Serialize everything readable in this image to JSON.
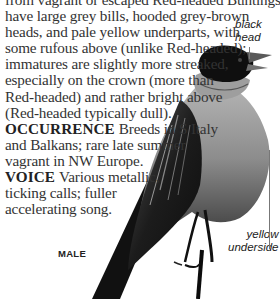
{
  "page": {
    "type": "field-guide-species-entry",
    "description_lines": [
      "from vagrant or escaped Red-headed Buntings. Females",
      "have large grey bills, hooded grey-brown",
      "heads, and pale yellow underparts, with",
      "some rufous above (unlike Red-headed);",
      "immatures are slightly more streaked,",
      "especially on the crown (more than",
      "Red-headed) and rather bright above",
      "(Red-headed typically dull)."
    ],
    "occurrence": {
      "heading": "OCCURRENCE",
      "lines": [
        "Breeds in S Italy",
        "and Balkans; rare late summer",
        "vagrant in NW Europe."
      ]
    },
    "voice": {
      "heading": "VOICE",
      "lines": [
        "Various metallic,",
        "ticking calls; fuller",
        "accelerating song."
      ]
    }
  },
  "illustration": {
    "subject": "bird photo (male bunting)",
    "caption": "MALE",
    "annotations": [
      {
        "text_line1": "black",
        "text_line2": "head"
      },
      {
        "text_line1": "yellow",
        "text_line2": "underside"
      }
    ]
  },
  "colors": {
    "text": "#333333",
    "background": "#ffffff",
    "leader_line": "#777777"
  }
}
